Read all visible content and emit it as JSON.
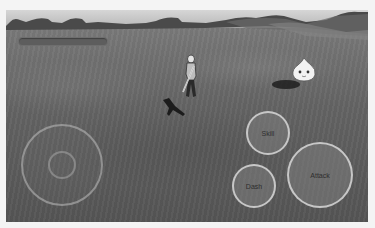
{
  "hud": {
    "health_bar": {
      "fill_percent": 100,
      "color": "#5d5d5d"
    }
  },
  "controls": {
    "joystick": {
      "label": ""
    },
    "skill_label": "Skill",
    "dash_label": "Dash",
    "attack_label": "Attack"
  },
  "scene": {
    "player": "swordsman-character",
    "enemy": "slime-enemy",
    "palette": {
      "sky": "#c9c9c9",
      "mountains": "#4a4a4a",
      "ground": "#646464",
      "button_border": "#d7d7d7"
    }
  }
}
